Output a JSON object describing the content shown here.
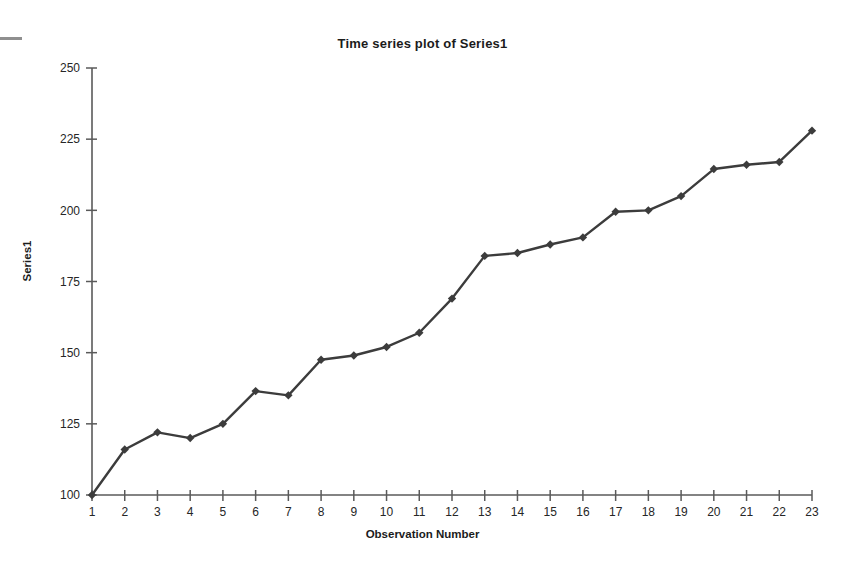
{
  "chart_data": {
    "type": "line",
    "title": "Time series plot of Series1",
    "xlabel": "Observation Number",
    "ylabel": "Series1",
    "x": [
      1,
      2,
      3,
      4,
      5,
      6,
      7,
      8,
      9,
      10,
      11,
      12,
      13,
      14,
      15,
      16,
      17,
      18,
      19,
      20,
      21,
      22,
      23
    ],
    "values": [
      100,
      116,
      122,
      120,
      125,
      136.5,
      135,
      147.5,
      149,
      152,
      157,
      169,
      184,
      185,
      188,
      190.5,
      199.5,
      200,
      205,
      214.5,
      216,
      217,
      228
    ],
    "series": [
      {
        "name": "Series1",
        "values": [
          100,
          116,
          122,
          120,
          125,
          136.5,
          135,
          147.5,
          149,
          152,
          157,
          169,
          184,
          185,
          188,
          190.5,
          199.5,
          200,
          205,
          214.5,
          216,
          217,
          228
        ]
      }
    ],
    "xlim": [
      1,
      23
    ],
    "ylim": [
      100,
      250
    ],
    "x_ticks": [
      "1",
      "2",
      "3",
      "4",
      "5",
      "6",
      "7",
      "8",
      "9",
      "10",
      "11",
      "12",
      "13",
      "14",
      "15",
      "16",
      "17",
      "18",
      "19",
      "20",
      "21",
      "22",
      "23"
    ],
    "y_ticks": [
      "100",
      "125",
      "150",
      "175",
      "200",
      "225",
      "250"
    ],
    "y_tick_values": [
      100,
      125,
      150,
      175,
      200,
      225,
      250
    ],
    "grid": false,
    "legend": false,
    "marker": "diamond",
    "line_color": "#3c3c3c",
    "marker_color": "#3c3c3c",
    "axis_color": "#5a5a5a",
    "background": "#ffffff"
  }
}
